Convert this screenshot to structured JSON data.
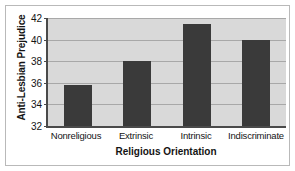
{
  "chart_data": {
    "type": "bar",
    "title": "",
    "xlabel": "Religious Orientation",
    "ylabel": "Anti-Lesbian Prejudice",
    "categories": [
      "Nonreligious",
      "Extrinsic",
      "Intrinsic",
      "Indiscriminate"
    ],
    "values": [
      35.8,
      38.0,
      41.4,
      40.0
    ],
    "ylim": [
      32,
      42
    ],
    "yticks": [
      32,
      34,
      36,
      38,
      40,
      42
    ],
    "grid": true,
    "legend": null,
    "colors": {
      "bar": "#3a3a3a",
      "plot_background": "#d9d9d9",
      "gridline": "#a8a8a8",
      "axis": "#4a4a4a",
      "text": "#141414",
      "frame_border": "#b9b9b9",
      "figure_background": "#ffffff"
    }
  }
}
